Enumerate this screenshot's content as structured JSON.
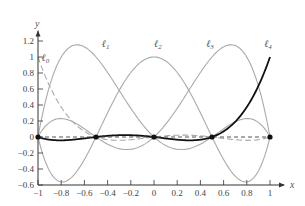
{
  "chart_data": {
    "type": "line",
    "title": "",
    "xlabel": "x",
    "ylabel": "y",
    "xlim": [
      -1,
      1
    ],
    "ylim": [
      -0.6,
      1.2
    ],
    "x_ticks": [
      "-1",
      "-0.8",
      "-0.6",
      "-0.4",
      "-0.2",
      "0",
      "0.2",
      "0.4",
      "0.6",
      "0.8",
      "1"
    ],
    "y_ticks": [
      "-0.6",
      "-0.4",
      "-0.2",
      "0",
      "0.2",
      "0.4",
      "0.6",
      "0.8",
      "1",
      "1.2"
    ],
    "nodes": [
      -1,
      -0.5,
      0,
      0.5,
      1
    ],
    "grid": false,
    "series": [
      {
        "name": "ℓ0",
        "node_index": 0,
        "style": "dashed",
        "color": "#aaaaaa"
      },
      {
        "name": "ℓ1",
        "node_index": 1,
        "style": "solid",
        "color": "#aaaaaa"
      },
      {
        "name": "ℓ2",
        "node_index": 2,
        "style": "solid",
        "color": "#aaaaaa"
      },
      {
        "name": "ℓ3",
        "node_index": 3,
        "style": "solid",
        "color": "#aaaaaa"
      },
      {
        "name": "ℓ4",
        "node_index": 4,
        "style": "solid-bold",
        "color": "#111111"
      }
    ],
    "annotations": [
      {
        "text": "ℓ0",
        "x": -0.97,
        "y": 0.95
      },
      {
        "text": "ℓ1",
        "x": -0.45,
        "y": 1.12
      },
      {
        "text": "ℓ2",
        "x": 0.0,
        "y": 1.12
      },
      {
        "text": "ℓ3",
        "x": 0.45,
        "y": 1.12
      },
      {
        "text": "ℓ4",
        "x": 0.95,
        "y": 1.12
      }
    ]
  }
}
